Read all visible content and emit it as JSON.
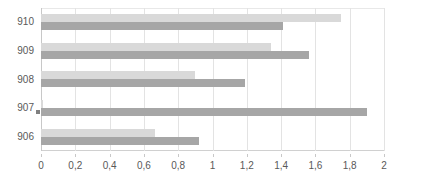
{
  "chart_data": {
    "type": "bar",
    "orientation": "horizontal",
    "title": "",
    "subtitle": "",
    "xlabel": "",
    "ylabel": "",
    "categories": [
      "910",
      "909",
      "908",
      "907",
      "906"
    ],
    "series": [
      {
        "name": "series-1",
        "color": "#d9d9d9",
        "values": [
          1.75,
          1.34,
          0.9,
          0.01,
          0.665
        ]
      },
      {
        "name": "series-2",
        "color": "#a6a6a6",
        "values": [
          1.41,
          1.56,
          1.19,
          1.9,
          0.92
        ]
      }
    ],
    "xlim": [
      0,
      2
    ],
    "xticks": [
      0,
      0.2,
      0.4,
      0.6,
      0.8,
      1,
      1.2,
      1.4,
      1.6,
      1.8,
      2
    ],
    "xtick_labels": [
      "0",
      "0,2",
      "0,4",
      "0,6",
      "0,8",
      "1",
      "1,2",
      "1,4",
      "1,6",
      "1,8",
      "2"
    ],
    "decimal_separator": ",",
    "grid": {
      "vertical": true,
      "horizontal": false
    },
    "legend": {
      "visible": false,
      "position": "none"
    },
    "annotations": [
      {
        "name": "row-marker",
        "category": "907",
        "text": ""
      }
    ],
    "colors": {
      "background": "#ffffff",
      "gridline": "#e3e3e3",
      "axis": "#c8c8c8",
      "tick_label": "#595959"
    }
  }
}
